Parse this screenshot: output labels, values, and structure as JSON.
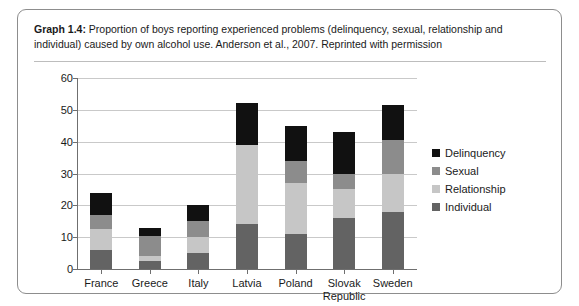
{
  "figure": {
    "caption_label": "Graph 1.4:",
    "caption_text": " Proportion of boys reporting experienced problems (delinquency, sexual, relationship and individual) caused by own alcohol use. Anderson et al., 2007. Reprinted with permission"
  },
  "chart_data": {
    "type": "bar",
    "stacked": true,
    "title": "",
    "xlabel": "",
    "ylabel": "",
    "ylim": [
      0,
      60
    ],
    "yticks": [
      0,
      10,
      20,
      30,
      40,
      50,
      60
    ],
    "grid": true,
    "legend_position": "right",
    "categories": [
      "France",
      "Greece",
      "Italy",
      "Latvia",
      "Poland",
      "Slovak Republic",
      "Sweden"
    ],
    "series": [
      {
        "name": "Individual",
        "color": "#636363",
        "values": [
          6,
          2.5,
          5,
          14,
          11,
          16,
          18
        ]
      },
      {
        "name": "Relationship",
        "color": "#c6c6c6",
        "values": [
          6.5,
          1.5,
          5,
          25,
          16,
          9,
          12
        ]
      },
      {
        "name": "Sexual",
        "color": "#8c8c8c",
        "values": [
          4.5,
          6.5,
          5,
          0,
          7,
          5,
          10.5
        ]
      },
      {
        "name": "Delinquency",
        "color": "#111111",
        "values": [
          7,
          2.5,
          5,
          13,
          11,
          13,
          11
        ]
      }
    ],
    "totals": [
      24,
      13,
      20,
      52,
      45,
      43,
      51.5
    ]
  },
  "legend": {
    "items": [
      {
        "label": "Delinquency",
        "color": "#111111"
      },
      {
        "label": "Sexual",
        "color": "#8c8c8c"
      },
      {
        "label": "Relationship",
        "color": "#c6c6c6"
      },
      {
        "label": "Individual",
        "color": "#636363"
      }
    ]
  }
}
